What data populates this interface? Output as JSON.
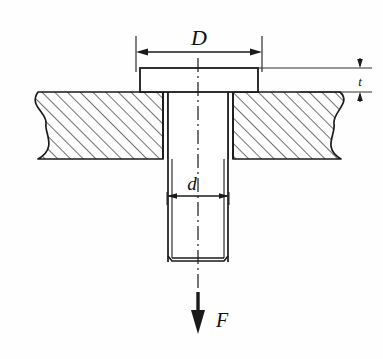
{
  "figure": {
    "type": "engineering-section-drawing",
    "background_color": "#fefefe",
    "line_color": "#1a1a1a",
    "hatch_color": "#333333"
  },
  "labels": {
    "head_diameter": "D",
    "shank_diameter": "d",
    "head_thickness": "t",
    "force": "F"
  },
  "dimensions": {
    "head_diameter": {
      "symbol": "D",
      "description": "Bolt head diameter",
      "x_left": 136,
      "x_right": 262,
      "y": 52,
      "arrows": "both"
    },
    "shank_diameter": {
      "symbol": "d",
      "description": "Bolt shank diameter",
      "x_left": 167,
      "x_right": 228,
      "y": 196,
      "arrows": "both"
    },
    "head_thickness": {
      "symbol": "t",
      "description": "Bolt head thickness",
      "x": 360,
      "y_top": 68,
      "y_bottom": 99,
      "arrows": "both"
    },
    "force": {
      "symbol": "F",
      "description": "Applied tensile force, downward",
      "x": 198,
      "y_start": 295,
      "y_end": 330,
      "direction": "down"
    }
  },
  "geometry": {
    "plate": {
      "top_y": 92,
      "bottom_y": 159,
      "left_x": 30,
      "right_x": 348,
      "hatch_angle_deg": 45,
      "hatch_spacing": 9,
      "break_lines": [
        "left",
        "right"
      ]
    },
    "bolt_head": {
      "left_x": 140,
      "right_x": 258,
      "top_y": 68,
      "bottom_y": 92
    },
    "shank": {
      "left_x": 163,
      "right_x": 233,
      "top_y": 92,
      "bottom_y": 262
    },
    "centerline": {
      "x": 198,
      "top_y": 60,
      "bottom_y": 300,
      "style": "dash-dot"
    }
  }
}
